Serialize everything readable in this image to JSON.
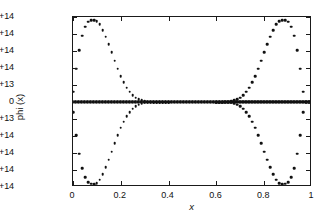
{
  "chart_data": {
    "type": "scatter",
    "title": "",
    "xlabel": "x",
    "ylabel": "phi (x)",
    "xlim": [
      0,
      1
    ],
    "ylim": [
      -250000000000000.0,
      250000000000000.0
    ],
    "grid": false,
    "legend": null,
    "xticks": [
      0,
      0.2,
      0.4,
      0.6,
      0.8,
      1
    ],
    "xticklabels": [
      "0",
      "0.2",
      "0.4",
      "0.6",
      "0.8",
      "1"
    ],
    "yticks": [
      250000000000000.0,
      200000000000000.0,
      150000000000000.0,
      100000000000000.0,
      50000000000000.0,
      0,
      -50000000000000.0,
      -100000000000000.0,
      -150000000000000.0,
      -200000000000000.0,
      -250000000000000.0
    ],
    "yticklabels": [
      "2.5e+14",
      "2e+14",
      "1.5e+14",
      "1e+14",
      "5e+13",
      "0",
      "−5e+13",
      "−1e+14",
      "−1.5e+14",
      "−2e+14",
      "−2.5e+14"
    ],
    "marker": "dot",
    "marker_color": "#111111",
    "series": [
      {
        "name": "phi-positive-branch",
        "description": "sinusoidal branch, two periods, amplitude 2.4e+14, starts near zero rising",
        "x": [
          0.0,
          0.0125,
          0.025,
          0.0375,
          0.05,
          0.0625,
          0.075,
          0.0875,
          0.1,
          0.1125,
          0.125,
          0.1375,
          0.15,
          0.1625,
          0.175,
          0.1875,
          0.2,
          0.2125,
          0.225,
          0.2375,
          0.25,
          0.2625,
          0.275,
          0.2875,
          0.3,
          0.3125,
          0.325,
          0.3375,
          0.35,
          0.3625,
          0.375,
          0.3875,
          0.4
        ],
        "y": [
          30000000000000.0,
          98000000000000.0,
          152000000000000.0,
          195000000000000.0,
          222000000000000.0,
          236000000000000.0,
          240000000000000.0,
          241000000000000.0,
          238000000000000.0,
          228000000000000.0,
          212000000000000.0,
          192000000000000.0,
          170000000000000.0,
          146000000000000.0,
          122000000000000.0,
          98000000000000.0,
          76000000000000.0,
          58000000000000.0,
          42000000000000.0,
          30000000000000.0,
          20000000000000.0,
          13000000000000.0,
          8000000000000.0,
          4500000000000.0,
          2400000000000.0,
          1200000000000.0,
          500000000000.0,
          200000000000.0,
          60000000000.0,
          0,
          0,
          0,
          0
        ]
      },
      {
        "name": "phi-negative-branch",
        "description": "mirror image of positive branch reflected about y = 0",
        "x": [
          0.0,
          0.0125,
          0.025,
          0.0375,
          0.05,
          0.0625,
          0.075,
          0.0875,
          0.1,
          0.1125,
          0.125,
          0.1375,
          0.15,
          0.1625,
          0.175,
          0.1875,
          0.2,
          0.2125,
          0.225,
          0.2375,
          0.25,
          0.2625,
          0.275,
          0.2875,
          0.3,
          0.3125,
          0.325,
          0.3375,
          0.35,
          0.3625,
          0.375,
          0.3875,
          0.4
        ],
        "y": [
          -30000000000000.0,
          -98000000000000.0,
          -152000000000000.0,
          -195000000000000.0,
          -222000000000000.0,
          -236000000000000.0,
          -240000000000000.0,
          -241000000000000.0,
          -238000000000000.0,
          -228000000000000.0,
          -212000000000000.0,
          -192000000000000.0,
          -170000000000000.0,
          -146000000000000.0,
          -122000000000000.0,
          -98000000000000.0,
          -76000000000000.0,
          -58000000000000.0,
          -42000000000000.0,
          -30000000000000.0,
          -20000000000000.0,
          -13000000000000.0,
          -8000000000000.0,
          -4500000000000.0,
          -2400000000000.0,
          -1200000000000.0,
          -500000000000.0,
          -200000000000.0,
          -60000000000.0,
          0,
          0,
          0,
          0
        ]
      },
      {
        "name": "phi-zero-line",
        "description": "dense series of points lying flat on y = 0 spanning the full x range",
        "x_range": [
          0,
          1
        ],
        "y_value": 0,
        "point_count": 160
      },
      {
        "name": "phi-positive-branch-right",
        "description": "second lobe rising from x=0.6 peaking near x=0.88 then falling to zero at x=1",
        "x": [
          0.6,
          0.6125,
          0.625,
          0.6375,
          0.65,
          0.6625,
          0.675,
          0.6875,
          0.7,
          0.7125,
          0.725,
          0.7375,
          0.75,
          0.7625,
          0.775,
          0.7875,
          0.8,
          0.8125,
          0.825,
          0.8375,
          0.85,
          0.8625,
          0.875,
          0.8875,
          0.9,
          0.9125,
          0.925,
          0.9375,
          0.95,
          0.9625,
          0.975,
          0.9875,
          1.0
        ],
        "y": [
          0,
          60000000000.0,
          200000000000.0,
          500000000000.0,
          1200000000000.0,
          2400000000000.0,
          4500000000000.0,
          8000000000000.0,
          13000000000000.0,
          20000000000000.0,
          30000000000000.0,
          42000000000000.0,
          58000000000000.0,
          76000000000000.0,
          98000000000000.0,
          122000000000000.0,
          146000000000000.0,
          170000000000000.0,
          192000000000000.0,
          212000000000000.0,
          228000000000000.0,
          238000000000000.0,
          241000000000000.0,
          240000000000000.0,
          236000000000000.0,
          222000000000000.0,
          195000000000000.0,
          152000000000000.0,
          98000000000000.0,
          30000000000000.0,
          -1000000000000.0,
          -1000000000000.0,
          -1000000000000.0
        ]
      },
      {
        "name": "phi-negative-branch-right",
        "description": "mirror of second lobe below the axis",
        "x": [
          0.6,
          0.6125,
          0.625,
          0.6375,
          0.65,
          0.6625,
          0.675,
          0.6875,
          0.7,
          0.7125,
          0.725,
          0.7375,
          0.75,
          0.7625,
          0.775,
          0.7875,
          0.8,
          0.8125,
          0.825,
          0.8375,
          0.85,
          0.8625,
          0.875,
          0.8875,
          0.9,
          0.9125,
          0.925,
          0.9375,
          0.95,
          0.9625,
          0.975,
          0.9875,
          1.0
        ],
        "y": [
          0,
          -60000000000.0,
          -200000000000.0,
          -500000000000.0,
          -1200000000000.0,
          -2400000000000.0,
          -4500000000000.0,
          -8000000000000.0,
          -13000000000000.0,
          -20000000000000.0,
          -30000000000000.0,
          -42000000000000.0,
          -58000000000000.0,
          -76000000000000.0,
          -98000000000000.0,
          -122000000000000.0,
          -146000000000000.0,
          -170000000000000.0,
          -192000000000000.0,
          -212000000000000.0,
          -228000000000000.0,
          -238000000000000.0,
          -241000000000000.0,
          -240000000000000.0,
          -236000000000000.0,
          -222000000000000.0,
          -195000000000000.0,
          -152000000000000.0,
          -98000000000000.0,
          -30000000000000.0,
          1000000000000.0,
          1000000000000.0,
          1000000000000.0
        ]
      }
    ]
  }
}
